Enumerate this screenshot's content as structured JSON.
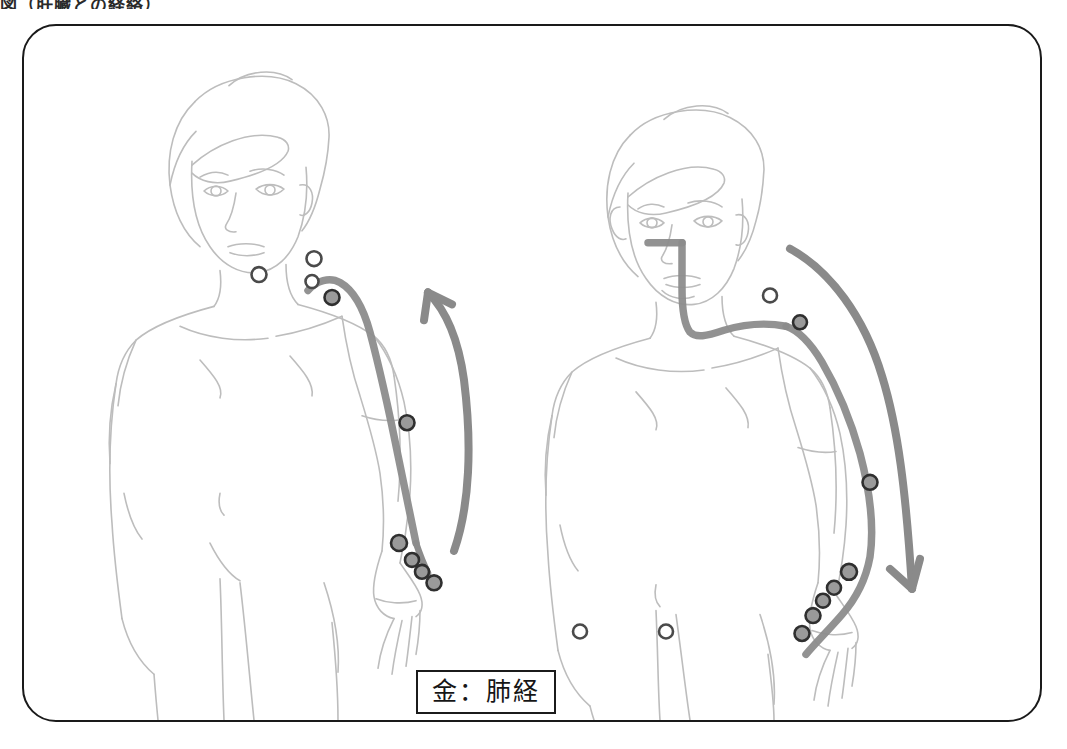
{
  "caption": {
    "top_text_partial": "図（肝臓との経絡）"
  },
  "figure": {
    "frame_color": "#1a1a1a",
    "background": "#ffffff",
    "body_outline_color": "#b8b8b8",
    "meridian_color": "#6f6f6f",
    "point_fill": "#8a8a8a",
    "point_stroke": "#3a3a3a",
    "arrow_color": "#7a7a7a"
  },
  "panels": [
    {
      "id": "lung-panel",
      "side": "left",
      "label": "金：肺経",
      "element_label": "金",
      "meridian_label": "肺経",
      "flow_direction": "upward",
      "arrow_name": "upward-flow-arrow",
      "figure_name": "female-body-front-left",
      "acupoints_hollow": 3,
      "acupoints_filled": 6,
      "meridian_start": "shoulder / clavicle",
      "meridian_end": "thumb"
    },
    {
      "id": "large-intestine-panel",
      "side": "right",
      "label": "金：大腸経",
      "element_label": "金",
      "meridian_label": "大腸経",
      "flow_direction": "downward",
      "arrow_name": "downward-flow-arrow",
      "figure_name": "female-body-front-right",
      "acupoints_hollow": 3,
      "acupoints_filled": 7,
      "meridian_start": "index finger / hand",
      "meridian_end": "nose / face"
    }
  ]
}
